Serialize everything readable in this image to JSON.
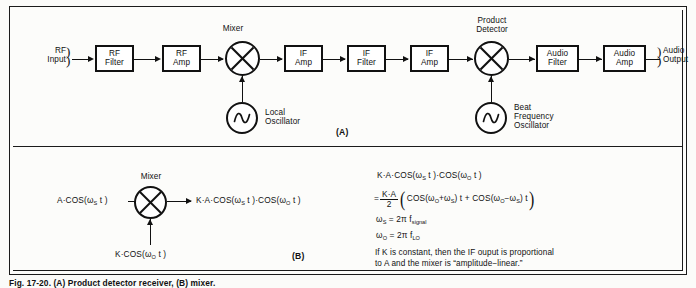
{
  "figure": {
    "caption": "Fig. 17-20.  (A) Product detector receiver, (B) mixer.",
    "panel_a_tag": "(A)",
    "panel_b_tag": "(B)"
  },
  "panel_a": {
    "title_labels": {
      "mixer": "Mixer",
      "product_detector_line1": "Product",
      "product_detector_line2": "Detector"
    },
    "input_port": {
      "line1": "RF",
      "line2": "Input",
      "bracket": ")"
    },
    "output_port": {
      "line1": "Audio",
      "line2": "Output",
      "bracket": ")"
    },
    "blocks": [
      {
        "name": "rf-filter",
        "line1": "RF",
        "line2": "Filter"
      },
      {
        "name": "rf-amp",
        "line1": "RF",
        "line2": "Amp"
      },
      {
        "name": "if-amp-1",
        "line1": "IF",
        "line2": "Amp"
      },
      {
        "name": "if-filter",
        "line1": "IF",
        "line2": "Filter"
      },
      {
        "name": "if-amp-2",
        "line1": "IF",
        "line2": "Amp"
      },
      {
        "name": "audio-filter",
        "line1": "Audio",
        "line2": "Filter"
      },
      {
        "name": "audio-amp",
        "line1": "Audio",
        "line2": "Amp"
      }
    ],
    "local_oscillator": {
      "line1": "Local",
      "line2": "Oscillator",
      "symbol": "sine-wave"
    },
    "beat_frequency_oscillator": {
      "line1": "Beat",
      "line2": "Frequency",
      "line3": "Oscillator",
      "symbol": "sine-wave"
    }
  },
  "panel_b": {
    "mixer_label": "Mixer",
    "input_signal": {
      "prefix": "A·COS(ω",
      "sub": "S",
      "suffix": " t )"
    },
    "input_lo": {
      "prefix": "K·COS(ω",
      "sub": "O",
      "suffix": " t )"
    },
    "output": {
      "p1": "K·A·COS(ω",
      "s1": "S",
      "p2": " t )·COS(ω",
      "s2": "O",
      "p3": " t )"
    },
    "math": {
      "line1": {
        "p1": "K·A·COS(ω",
        "s1": "S",
        "p2": " t )·COS(ω",
        "s2": "O",
        "p3": " t )"
      },
      "line2": {
        "eq": "=",
        "frac_num": "K·A",
        "frac_den": "2",
        "inner_p1": "COS(ω",
        "inner_s1": "O",
        "inner_p2": "+ω",
        "inner_s2": "S",
        "inner_p3": ") t  +  COS(ω",
        "inner_s3": "O",
        "inner_p4": "−ω",
        "inner_s4": "S",
        "inner_p5": ") t"
      },
      "line3": {
        "lhs_p": "ω",
        "lhs_s": "S",
        "rhs_p": " = 2π f",
        "rhs_s": "signal"
      },
      "line4": {
        "lhs_p": "ω",
        "lhs_s": "O",
        "rhs_p": " = 2π f",
        "rhs_s": "LO"
      }
    },
    "prose_line1": "If K is constant, then the IF ouput is proportional",
    "prose_line2": "to A and the mixer is “amplitude−linear.”"
  },
  "colors": {
    "ink": "#111111",
    "paper": "#fcfcfa",
    "block_fill": "#ffffff"
  }
}
